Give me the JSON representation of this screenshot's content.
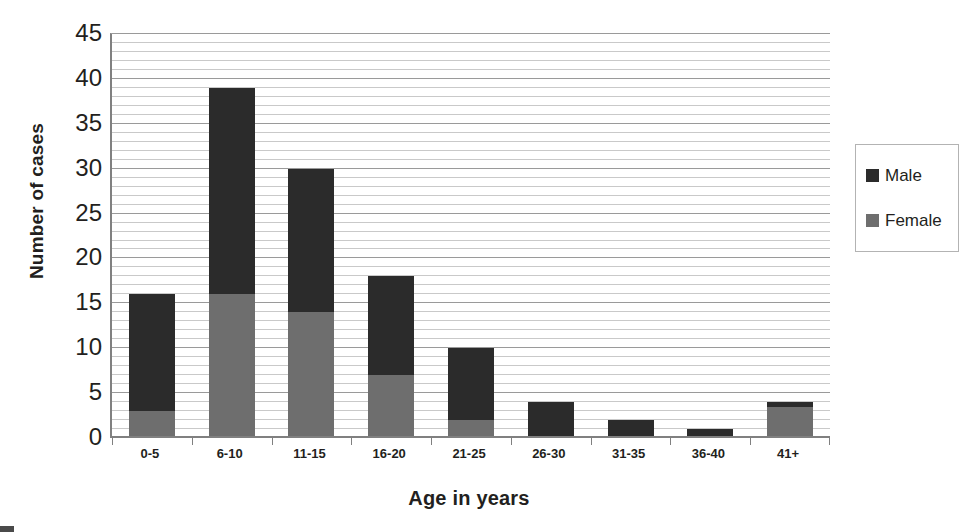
{
  "chart_data": {
    "type": "bar",
    "subtype": "stacked",
    "title": "",
    "xlabel": "Age in years",
    "ylabel": "Number of cases",
    "categories": [
      "0-5",
      "6-10",
      "11-15",
      "16-20",
      "21-25",
      "26-30",
      "31-35",
      "36-40",
      "41+"
    ],
    "series": [
      {
        "name": "Female",
        "color": "#6e6e6e",
        "values": [
          3,
          16,
          14,
          7,
          2,
          0,
          0,
          0,
          3.5
        ]
      },
      {
        "name": "Male",
        "color": "#2b2b2b",
        "values": [
          13,
          23,
          16,
          11,
          8,
          4,
          2,
          1,
          0.5
        ]
      }
    ],
    "stack_order": [
      "Female",
      "Male"
    ],
    "totals": [
      16,
      39,
      30,
      18,
      10,
      4,
      2,
      1,
      4
    ],
    "ylim": [
      0,
      45
    ],
    "ytick_step": 5,
    "yticks": [
      0,
      5,
      10,
      15,
      20,
      25,
      30,
      35,
      40,
      45
    ],
    "ytick_labels": [
      "0",
      "5",
      "10",
      "15",
      "20",
      "25",
      "30",
      "35",
      "40",
      "45"
    ],
    "minor_gridline_step": 1,
    "grid": true,
    "grid_axis": "y",
    "legend": {
      "position": "right",
      "entries": [
        {
          "label": "Male",
          "color": "#2b2b2b"
        },
        {
          "label": "Female",
          "color": "#6e6e6e"
        }
      ]
    }
  },
  "colors": {
    "male": "#2b2b2b",
    "female": "#6e6e6e",
    "gridline_minor": "#c9c9c9",
    "gridline_major": "#9a9a9a",
    "axis": "#808080",
    "text": "#231f20",
    "background": "#ffffff",
    "legend_border": "#b3b3b3"
  }
}
